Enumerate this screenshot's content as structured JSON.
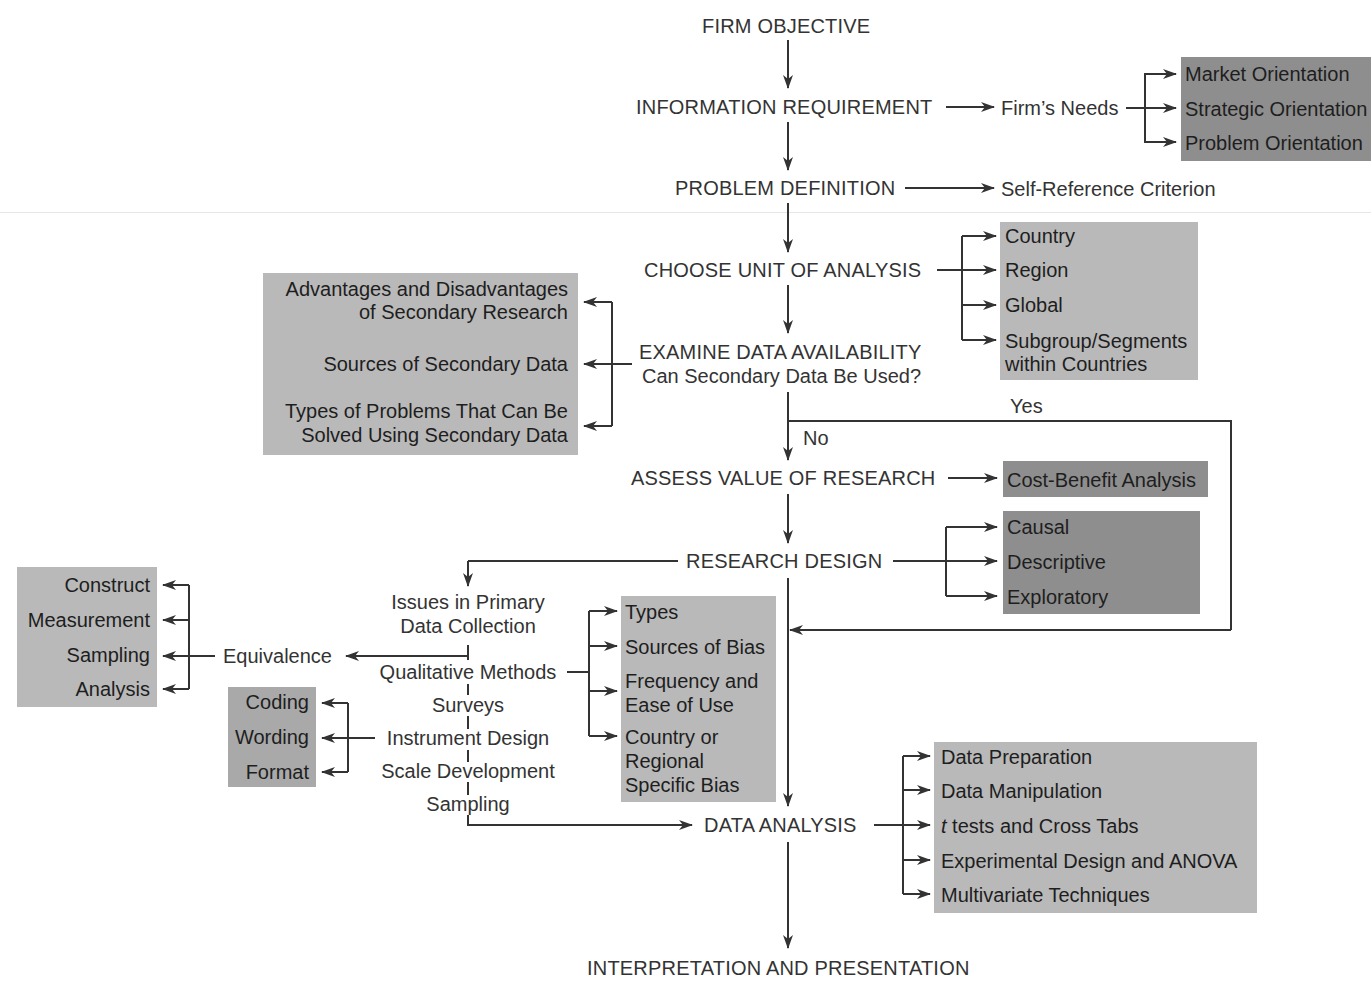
{
  "diagram": {
    "main_flow": [
      "FIRM OBJECTIVE",
      "INFORMATION REQUIREMENT",
      "PROBLEM DEFINITION",
      "CHOOSE UNIT OF ANALYSIS",
      "EXAMINE DATA AVAILABILITY",
      "ASSESS VALUE OF RESEARCH",
      "RESEARCH DESIGN",
      "DATA ANALYSIS",
      "INTERPRETATION AND PRESENTATION"
    ],
    "examine_subtitle": "Can Secondary Data Be Used?",
    "decision": {
      "yes": "Yes",
      "no": "No"
    },
    "firms_needs": {
      "label": "Firm’s Needs",
      "items": [
        "Market Orientation",
        "Strategic Orientation",
        "Problem Orientation"
      ]
    },
    "self_reference": "Self-Reference Criterion",
    "unit_of_analysis": {
      "items": [
        "Country",
        "Region",
        "Global",
        "Subgroup/Segments",
        "within Countries"
      ]
    },
    "secondary": {
      "items": [
        "Advantages and Disadvantages",
        "of Secondary Research",
        "Sources of Secondary Data",
        "Types of Problems That Can Be",
        "Solved Using Secondary Data"
      ]
    },
    "assess_value": {
      "items": [
        "Cost-Benefit Analysis"
      ]
    },
    "research_design": {
      "items": [
        "Causal",
        "Descriptive",
        "Exploratory"
      ]
    },
    "primary": {
      "title_lines": [
        "Issues in Primary",
        "Data Collection"
      ],
      "items": [
        "Qualitative Methods",
        "Surveys",
        "Instrument Design",
        "Scale Development",
        "Sampling"
      ]
    },
    "equivalence": {
      "label": "Equivalence",
      "items": [
        "Construct",
        "Measurement",
        "Sampling",
        "Analysis"
      ]
    },
    "instrument": {
      "items": [
        "Coding",
        "Wording",
        "Format"
      ]
    },
    "qualitative": {
      "items": [
        "Types",
        "Sources of Bias",
        "Frequency and",
        "Ease of Use",
        "Country or",
        "Regional",
        "Specific Bias"
      ]
    },
    "data_analysis": {
      "items": [
        "Data Preparation",
        "Data Manipulation",
        "t",
        " tests and Cross Tabs",
        "Experimental Design and ANOVA",
        "Multivariate Techniques"
      ]
    },
    "colors": {
      "dark_box": "#8e8e8e",
      "mid_box": "#a9a9a9",
      "light_box": "#b9b9b9",
      "line": "#333333"
    }
  }
}
